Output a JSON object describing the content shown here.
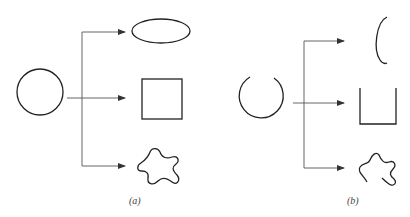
{
  "figure": {
    "panels": [
      {
        "id": "a",
        "label": "(a)",
        "source_shape": "closed circle",
        "targets": [
          "ellipse",
          "square",
          "closed irregular blob"
        ]
      },
      {
        "id": "b",
        "label": "(b)",
        "source_shape": "open circle (gap at top)",
        "targets": [
          "open ellipse arc (C-shape)",
          "open square (U-shape)",
          "open irregular curve"
        ]
      }
    ],
    "colors": {
      "stroke": "#222222",
      "arrow": "#444444",
      "background": "#ffffff"
    }
  }
}
